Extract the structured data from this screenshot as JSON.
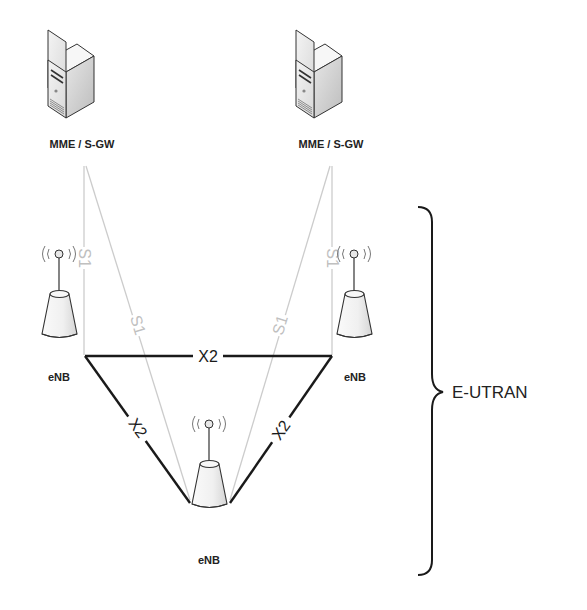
{
  "diagram": {
    "type": "network-topology",
    "colors": {
      "x2_link": "#1a1a1a",
      "s1_link": "#c8c8c8",
      "s1_label": "#c0c0c0",
      "text": "#222222"
    },
    "nodes": {
      "server_left": {
        "label": "MME / S-GW",
        "icon": "server-icon"
      },
      "server_right": {
        "label": "MME / S-GW",
        "icon": "server-icon"
      },
      "enb_left": {
        "label": "eNB",
        "icon": "base-station-icon"
      },
      "enb_right": {
        "label": "eNB",
        "icon": "base-station-icon"
      },
      "enb_bottom": {
        "label": "eNB",
        "icon": "base-station-icon"
      }
    },
    "links": {
      "x2_top": {
        "label": "X2",
        "from": "enb_left",
        "to": "enb_right",
        "type": "X2"
      },
      "x2_left": {
        "label": "X2",
        "from": "enb_left",
        "to": "enb_bottom",
        "type": "X2"
      },
      "x2_right": {
        "label": "X2",
        "from": "enb_right",
        "to": "enb_bottom",
        "type": "X2"
      },
      "s1_left_vertical": {
        "label": "S1",
        "from": "server_left",
        "to": "enb_left",
        "type": "S1"
      },
      "s1_left_diag": {
        "label": "S1",
        "from": "server_left",
        "to": "enb_bottom",
        "type": "S1"
      },
      "s1_right_vertical": {
        "label": "S1",
        "from": "server_right",
        "to": "enb_right",
        "type": "S1"
      },
      "s1_right_diag": {
        "label": "S1",
        "from": "server_right",
        "to": "enb_bottom",
        "type": "S1"
      }
    },
    "group": {
      "label": "E-UTRAN",
      "brace": "right-curly-brace"
    }
  }
}
